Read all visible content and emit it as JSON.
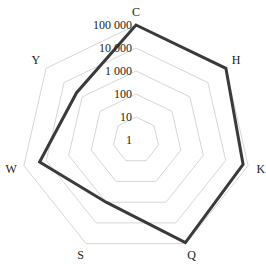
{
  "chart_data": {
    "type": "radar",
    "scale": "log",
    "categories": [
      "C",
      "H",
      "K",
      "Q",
      "S",
      "W",
      "Y"
    ],
    "series": [
      {
        "name": "series",
        "values": [
          100000,
          100000,
          60000,
          90000,
          1000,
          20000,
          2000
        ],
        "color": "#3a3a3a"
      }
    ],
    "radial_ticks": [
      1,
      10,
      100,
      1000,
      10000,
      100000
    ],
    "radial_tick_labels": [
      "1",
      "10",
      "100",
      "1 000",
      "10 000",
      "100 000"
    ],
    "rlim": [
      1,
      100000
    ],
    "grid": true,
    "grid_color": "#d6d6d6",
    "title": "",
    "legend": null
  }
}
